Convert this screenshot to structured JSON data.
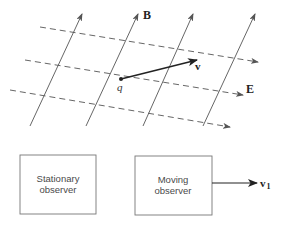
{
  "figure": {
    "field_labels": {
      "magnetic": "B",
      "electric": "E"
    },
    "charge": {
      "label": "q",
      "position": [
        121,
        79
      ]
    },
    "velocity": {
      "label": "v",
      "from": [
        121,
        79
      ],
      "to": [
        197,
        60
      ]
    },
    "b_field_lines": [
      {
        "from": [
          30,
          126
        ],
        "to": [
          82,
          14
        ]
      },
      {
        "from": [
          86,
          126
        ],
        "to": [
          138,
          14
        ]
      },
      {
        "from": [
          143,
          126
        ],
        "to": [
          193,
          14
        ]
      },
      {
        "from": [
          203,
          126
        ],
        "to": [
          255,
          14
        ]
      }
    ],
    "e_field_lines": [
      {
        "from": [
          40,
          27
        ],
        "to": [
          258,
          62
        ]
      },
      {
        "from": [
          25,
          60
        ],
        "to": [
          243,
          95
        ]
      },
      {
        "from": [
          10,
          90
        ],
        "to": [
          230,
          127
        ]
      }
    ],
    "observers": [
      {
        "line1": "Stationary",
        "line2": "observer"
      },
      {
        "line1": "Moving",
        "line2": "observer"
      }
    ],
    "observer_velocity": {
      "label": "v",
      "subscript": "1"
    },
    "colors": {
      "line": "#555555",
      "vector": "#222222",
      "box_border": "#777777",
      "background": "#ffffff"
    }
  }
}
